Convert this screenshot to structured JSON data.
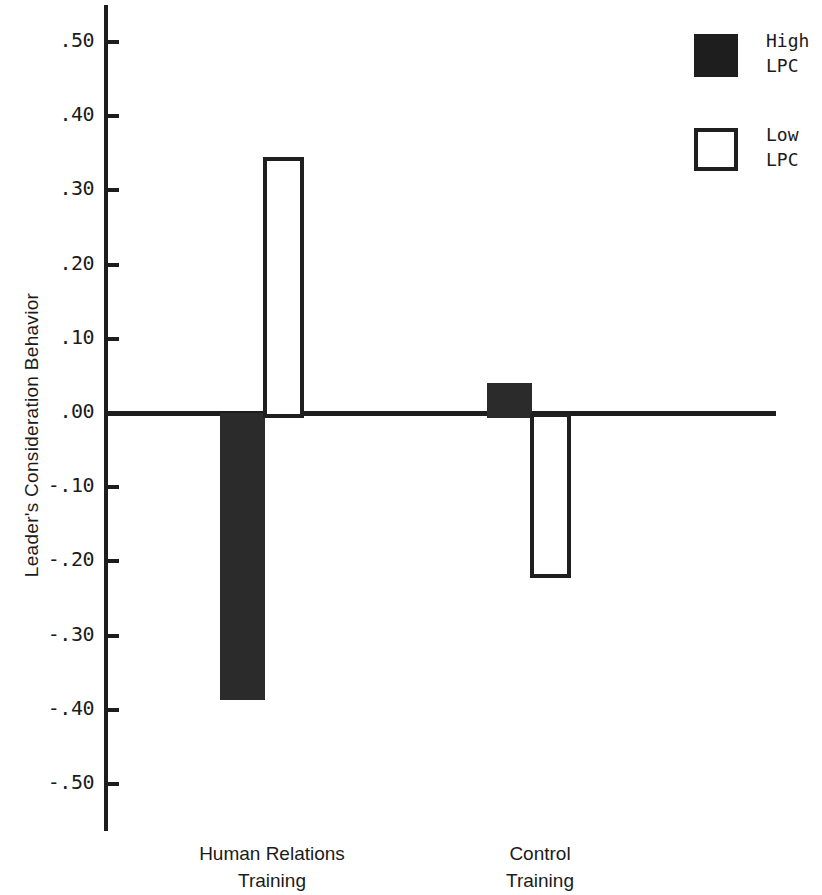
{
  "chart_data": {
    "type": "bar",
    "title": "",
    "subtitle": "",
    "xlabel": "",
    "ylabel": "Leader's Consideration Behavior",
    "categories": [
      "Human Relations\nTraining",
      "Control\nTraining"
    ],
    "series": [
      {
        "name": "High\nLPC",
        "legend_label": "High\nLPC",
        "style": "filled",
        "color": "#2b2b2b",
        "values": [
          -0.38,
          0.04
        ]
      },
      {
        "name": "Low\nLPC",
        "legend_label": "Low\nLPC",
        "style": "hollow",
        "color": "#ffffff",
        "values": [
          0.345,
          -0.215
        ]
      }
    ],
    "ylim": [
      -0.55,
      0.55
    ],
    "yticks": [
      0.5,
      0.4,
      0.3,
      0.2,
      0.1,
      0.0,
      -0.1,
      -0.2,
      -0.3,
      -0.4,
      -0.5
    ],
    "ytick_labels": [
      ".50",
      ".40",
      ".30",
      ".20",
      ".10",
      ".00",
      "-.10",
      "-.20",
      "-.30",
      "-.40",
      "-.50"
    ],
    "grid": false,
    "legend_position": "top-right",
    "baseline_value": 0.0,
    "annotations": []
  },
  "axis": {
    "ylabel": "Leader's Consideration Behavior",
    "ticks": [
      {
        "label": ".50",
        "value": 0.5
      },
      {
        "label": ".40",
        "value": 0.4
      },
      {
        "label": ".30",
        "value": 0.3
      },
      {
        "label": ".20",
        "value": 0.2
      },
      {
        "label": ".10",
        "value": 0.1
      },
      {
        "label": ".00",
        "value": 0.0
      },
      {
        "label": "-.10",
        "value": -0.1
      },
      {
        "label": "-.20",
        "value": -0.2
      },
      {
        "label": "-.30",
        "value": -0.3
      },
      {
        "label": "-.40",
        "value": -0.4
      },
      {
        "label": "-.50",
        "value": -0.5
      }
    ]
  },
  "categories": [
    {
      "label": "Human Relations\nTraining"
    },
    {
      "label": "Control\nTraining"
    }
  ],
  "legend": {
    "entries": [
      {
        "label": "High\nLPC",
        "style": "filled"
      },
      {
        "label": "Low\nLPC",
        "style": "hollow"
      }
    ]
  }
}
